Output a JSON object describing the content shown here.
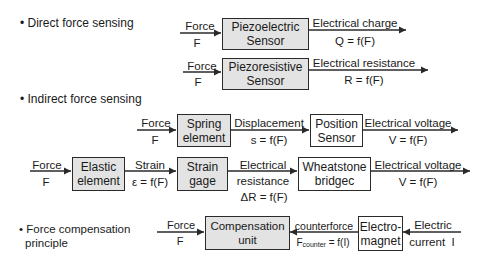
{
  "sections": {
    "direct": {
      "bullet": "• Direct force sensing"
    },
    "indirect": {
      "bullet": "• Indirect force sensing"
    },
    "compensation": {
      "bullet_line1": "• Force compensation",
      "bullet_line2": "principle"
    }
  },
  "rows": {
    "piezoelectric": {
      "input_top": "Force",
      "input_bottom": "F",
      "box_line1": "Piezoelectric",
      "box_line2": "Sensor",
      "output_top": "Electrical charge",
      "output_bottom": "Q = f(F)"
    },
    "piezoresistive": {
      "input_top": "Force",
      "input_bottom": "F",
      "box_line1": "Piezoresistive",
      "box_line2": "Sensor",
      "output_top": "Electrical resistance",
      "output_bottom": "R = f(F)"
    },
    "spring": {
      "input_top": "Force",
      "input_bottom": "F",
      "box1_line1": "Spring",
      "box1_line2": "element",
      "mid_top": "Displacement",
      "mid_bottom": "s = f(F)",
      "box2_line1": "Position",
      "box2_line2": "Sensor",
      "output_top": "Electrical voltage",
      "output_bottom": "V = f(F)"
    },
    "strain": {
      "input_top": "Force",
      "input_bottom": "F",
      "box1_line1": "Elastic",
      "box1_line2": "element",
      "mid1_top": "Strain",
      "mid1_bottom": "ε = f(F)",
      "box2_line1": "Strain",
      "box2_line2": "gage",
      "mid2_line1": "Electrical",
      "mid2_line2": "resistance",
      "mid2_line3": "ΔR = f(F)",
      "box3_line1": "Wheatstone",
      "box3_line2": "bridgec",
      "output_top": "Electrical voltage",
      "output_bottom": "V = f(F)"
    },
    "compensation": {
      "input_top": "Force",
      "input_bottom": "F",
      "box1_line1": "Compensation",
      "box1_line2": "unit",
      "mid_top": "counterforce",
      "mid_bottom_main": "F",
      "mid_bottom_sub": "counter",
      "mid_bottom_rest": " = f(I)",
      "box2_line1": "Electro-",
      "box2_line2": "magnet",
      "right_top": "Electric",
      "right_bottom": "current  I"
    }
  },
  "colors": {
    "box_fill_gray": "#e3e3e3",
    "box_fill_white": "#ffffff",
    "line": "#2a2a2a"
  }
}
